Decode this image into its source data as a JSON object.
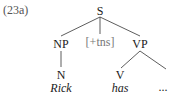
{
  "example_label": "(23a)",
  "tree": {
    "root": "S",
    "children": {
      "np": "NP",
      "tense": "[+tns]",
      "vp": "VP"
    },
    "np_child": {
      "category": "N",
      "word": "Rick"
    },
    "vp_children": {
      "v": {
        "category": "V",
        "word": "has"
      },
      "rest": "..."
    }
  },
  "colors": {
    "text": "#1a1a1a",
    "feature_text": "#777777",
    "lines": "#333333"
  }
}
